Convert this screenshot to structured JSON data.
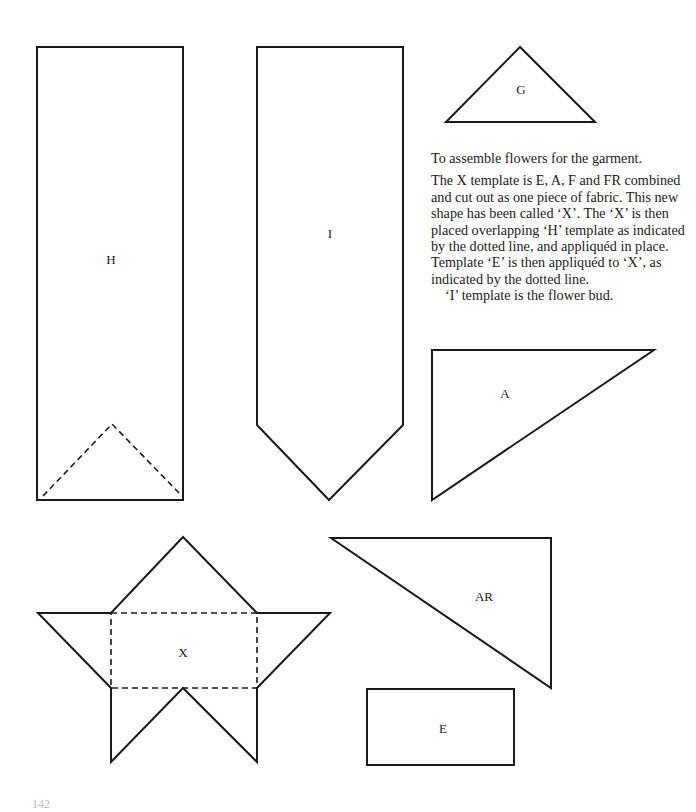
{
  "templates": {
    "H": {
      "label": "H"
    },
    "I": {
      "label": "I"
    },
    "G": {
      "label": "G"
    },
    "A": {
      "label": "A"
    },
    "AR": {
      "label": "AR"
    },
    "X": {
      "label": "X"
    },
    "E": {
      "label": "E"
    }
  },
  "instructions": {
    "heading": "To assemble flowers for the garment.",
    "paragraph": "The X template is E, A, F and FR combined and cut out as one piece of fabric. This new shape has been called ‘X’. The ‘X’ is then placed overlapping ‘H’ template as indicated by the dotted line, and appliquéd in place. Template ‘E’ is then appliquéd to ‘X’, as indicated by the dotted line.",
    "note": "‘I’ template is the flower bud."
  },
  "page": {
    "number": "142"
  },
  "colors": {
    "ink": "#1a1a1a",
    "paper": "#ffffff"
  }
}
